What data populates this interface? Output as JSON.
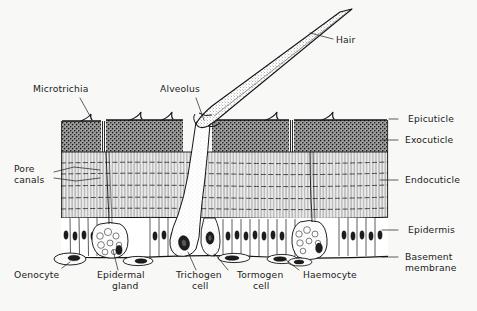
{
  "figure": {
    "background_color": "#f8f8f6",
    "ink_color": "#1b1b1b"
  },
  "labels": {
    "hair": "Hair",
    "microtrichia": "Microtrichia",
    "alveolus": "Alveolus",
    "pore_canals_line1": "Pore",
    "pore_canals_line2": "canals",
    "epicuticle": "Epicuticle",
    "exocuticle": "Exocuticle",
    "endocuticle": "Endocuticle",
    "epidermis": "Epidermis",
    "basement_membrane_line1": "Basement",
    "basement_membrane_line2": "membrane",
    "oenocyte": "Oenocyte",
    "epidermal_gland_line1": "Epidermal",
    "epidermal_gland_line2": "gland",
    "trichogen_cell_line1": "Trichogen",
    "trichogen_cell_line2": "cell",
    "tormogen_cell_line1": "Tormogen",
    "tormogen_cell_line2": "cell",
    "haemocyte": "Haemocyte"
  },
  "layers": [
    {
      "name": "epicuticle",
      "label": "Epicuticle",
      "description": "thin outer line at cuticle surface",
      "fill": "#1b1b1b"
    },
    {
      "name": "exocuticle",
      "label": "Exocuticle",
      "description": "dark densely stippled band",
      "fill": "#3a3a3a"
    },
    {
      "name": "endocuticle",
      "label": "Endocuticle",
      "description": "pale band with vertical pore canals and horizontal lamellae",
      "fill": "#ffffff"
    },
    {
      "name": "epidermis",
      "label": "Epidermis",
      "description": "row of columnar cells with oval nuclei",
      "fill": "#ffffff"
    },
    {
      "name": "basement-membrane",
      "label": "Basement membrane",
      "description": "basal boundary line",
      "fill": "#1b1b1b"
    }
  ],
  "structures": [
    {
      "name": "hair",
      "label": "Hair",
      "description": "long tapering stippled seta emerging from alveolus"
    },
    {
      "name": "microtrichia",
      "label": "Microtrichia",
      "description": "small curved hooks on cuticle surface"
    },
    {
      "name": "alveolus",
      "label": "Alveolus",
      "description": "socket at hair base"
    },
    {
      "name": "pore-canals",
      "label": "Pore canals",
      "description": "vertical channels through endocuticle"
    },
    {
      "name": "trichogen-cell",
      "label": "Trichogen cell",
      "description": "flask-shaped hair-forming cell"
    },
    {
      "name": "tormogen-cell",
      "label": "Tormogen cell",
      "description": "socket-forming cell beside trichogen"
    },
    {
      "name": "epidermal-gland",
      "label": "Epidermal gland",
      "description": "rounded vesiculate gland in epidermis"
    },
    {
      "name": "oenocyte",
      "label": "Oenocyte",
      "description": "flattened elliptical cell below basement membrane"
    },
    {
      "name": "haemocyte",
      "label": "Haemocyte",
      "description": "flattened blood cell below basement membrane"
    }
  ]
}
